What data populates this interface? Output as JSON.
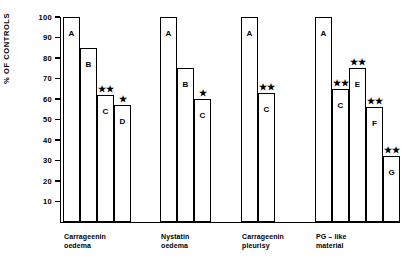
{
  "chart_data": {
    "type": "bar",
    "title": "",
    "xlabel": "",
    "ylabel": "% OF CONTROLS",
    "ylim": [
      0,
      100
    ],
    "yticks": [
      10,
      20,
      30,
      40,
      50,
      60,
      70,
      80,
      90,
      100
    ],
    "grid": false,
    "legend": "none",
    "axis_color": "#000000",
    "bar_fill": "#ffffff",
    "bar_edge": "#000000",
    "groups": [
      {
        "name": "group-carrageenin-oedema",
        "label": "Carrageenin\noedema",
        "bars": [
          {
            "letter": "A",
            "value": 100,
            "significance": ""
          },
          {
            "letter": "B",
            "value": 85,
            "significance": ""
          },
          {
            "letter": "C",
            "value": 62,
            "significance": "★★"
          },
          {
            "letter": "D",
            "value": 57,
            "significance": "★"
          }
        ]
      },
      {
        "name": "group-nystatin-oedema",
        "label": "Nystatin\noedema",
        "bars": [
          {
            "letter": "A",
            "value": 100,
            "significance": ""
          },
          {
            "letter": "B",
            "value": 75,
            "significance": ""
          },
          {
            "letter": "C",
            "value": 60,
            "significance": "★"
          }
        ]
      },
      {
        "name": "group-carrageenin-pleurisy",
        "label": "Carrageenin\npleurisy",
        "bars": [
          {
            "letter": "A",
            "value": 100,
            "significance": ""
          },
          {
            "letter": "C",
            "value": 63,
            "significance": "★★"
          }
        ]
      },
      {
        "name": "group-pg-like-material",
        "label": "PG – like\nmaterial",
        "bars": [
          {
            "letter": "A",
            "value": 100,
            "significance": ""
          },
          {
            "letter": "C",
            "value": 65,
            "significance": "★★"
          },
          {
            "letter": "E",
            "value": 75,
            "significance": "★★"
          },
          {
            "letter": "F",
            "value": 56,
            "significance": "★★"
          },
          {
            "letter": "G",
            "value": 32,
            "significance": "★★"
          }
        ]
      }
    ]
  }
}
